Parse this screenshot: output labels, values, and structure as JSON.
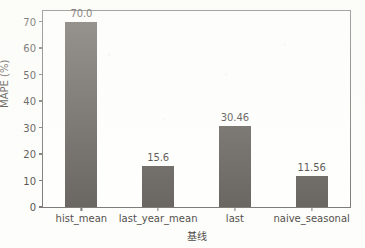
{
  "chart_data": {
    "type": "bar",
    "title": "",
    "xlabel": "基线",
    "ylabel": "MAPE (%)",
    "categories": [
      "hist_mean",
      "last_year_mean",
      "last",
      "naive_seasonal"
    ],
    "values": [
      70.0,
      15.6,
      30.46,
      11.56
    ],
    "data_labels": [
      "70.0",
      "15.6",
      "30.46",
      "11.56"
    ],
    "yticks": [
      0,
      10,
      20,
      30,
      40,
      50,
      60,
      70
    ],
    "ytick_labels": [
      "0",
      "10",
      "20",
      "30",
      "40",
      "50",
      "60",
      "70"
    ],
    "ylim": [
      0,
      74
    ],
    "xtick_labels": [
      "hist_mean",
      "last_year_mean",
      "last",
      "naive_seasonal"
    ],
    "grid": false,
    "legend": false,
    "bar_color": "#3a3430",
    "axis_color": "#56524e",
    "background_color": "#fdfdfb",
    "text_color": "#17120f"
  }
}
